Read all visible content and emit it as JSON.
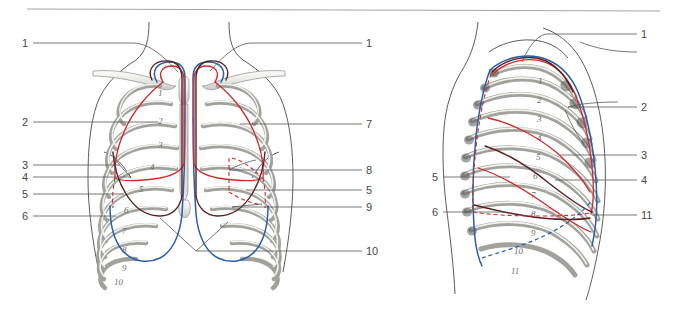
{
  "figure": {
    "top_rule": true,
    "colors": {
      "pleura_line": "#2a5fa8",
      "lung_line": "#cf2a2a",
      "deep_line": "#5a2020",
      "bone_outline": "#8a8a8a",
      "bone_fill": "#e3e3e1",
      "leader_line": "#555555",
      "body_outline": "#4a4a4a",
      "label_text": "#4a4a4a"
    }
  },
  "panels": [
    {
      "name": "anterior-view",
      "view": "anterior",
      "rib_numbers": [
        "1",
        "2",
        "3",
        "4",
        "5",
        "6",
        "7",
        "8",
        "9",
        "10"
      ],
      "labels_left": [
        {
          "id": "a-l-1",
          "text": "1",
          "x": 22,
          "y": 38
        },
        {
          "id": "a-l-2",
          "text": "2",
          "x": 22,
          "y": 117
        },
        {
          "id": "a-l-3",
          "text": "3",
          "x": 22,
          "y": 160
        },
        {
          "id": "a-l-4",
          "text": "4",
          "x": 22,
          "y": 172
        },
        {
          "id": "a-l-5",
          "text": "5",
          "x": 22,
          "y": 189
        },
        {
          "id": "a-l-6",
          "text": "6",
          "x": 22,
          "y": 211
        }
      ],
      "labels_right": [
        {
          "id": "a-r-1",
          "text": "1",
          "x": 366,
          "y": 38
        },
        {
          "id": "a-r-7",
          "text": "7",
          "x": 366,
          "y": 119
        },
        {
          "id": "a-r-8",
          "text": "8",
          "x": 366,
          "y": 165
        },
        {
          "id": "a-r-5",
          "text": "5",
          "x": 366,
          "y": 185
        },
        {
          "id": "a-r-9",
          "text": "9",
          "x": 366,
          "y": 202
        },
        {
          "id": "a-r-10",
          "text": "10",
          "x": 366,
          "y": 246
        }
      ]
    },
    {
      "name": "lateral-view",
      "view": "lateral",
      "rib_numbers": [
        "1",
        "2",
        "3",
        "4",
        "5",
        "6",
        "7",
        "8",
        "9",
        "10",
        "11"
      ],
      "labels_left": [
        {
          "id": "b-l-5",
          "text": "5",
          "x": 432,
          "y": 172
        },
        {
          "id": "b-l-6",
          "text": "6",
          "x": 432,
          "y": 207
        }
      ],
      "labels_right": [
        {
          "id": "b-r-1",
          "text": "1",
          "x": 641,
          "y": 29
        },
        {
          "id": "b-r-2",
          "text": "2",
          "x": 641,
          "y": 102
        },
        {
          "id": "b-r-3",
          "text": "3",
          "x": 641,
          "y": 150
        },
        {
          "id": "b-r-4",
          "text": "4",
          "x": 641,
          "y": 175
        },
        {
          "id": "b-r-11",
          "text": "11",
          "x": 641,
          "y": 210
        }
      ]
    }
  ]
}
